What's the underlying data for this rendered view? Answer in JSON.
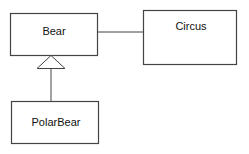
{
  "diagram": {
    "type": "uml-class-diagram",
    "classes": [
      {
        "id": "bear",
        "name": "Bear"
      },
      {
        "id": "circus",
        "name": "Circus"
      },
      {
        "id": "polarbear",
        "name": "PolarBear"
      }
    ],
    "relationships": [
      {
        "type": "association",
        "from": "Bear",
        "to": "Circus"
      },
      {
        "type": "inheritance",
        "from": "PolarBear",
        "to": "Bear"
      }
    ],
    "colors": {
      "stroke": "#444444",
      "background": "#ffffff",
      "text": "#111111"
    }
  }
}
